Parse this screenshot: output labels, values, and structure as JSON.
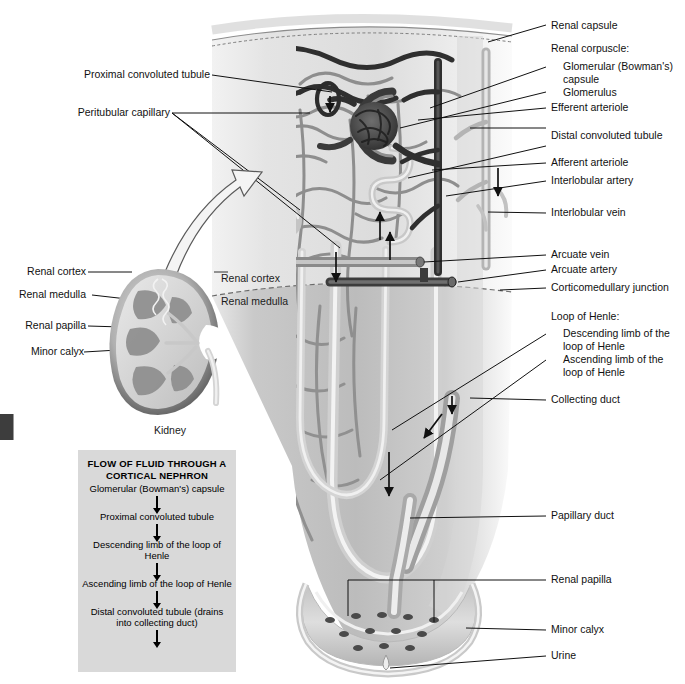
{
  "figure": {
    "background": "#ffffff",
    "line_color": "#111111"
  },
  "inset": {
    "caption": "Kidney",
    "labels": [
      {
        "id": "renal-cortex",
        "text": "Renal cortex"
      },
      {
        "id": "renal-medulla",
        "text": "Renal medulla"
      },
      {
        "id": "renal-papilla",
        "text": "Renal papilla"
      },
      {
        "id": "minor-calyx",
        "text": "Minor calyx"
      }
    ]
  },
  "main_labels_left": [
    {
      "id": "proximal-convoluted-tubule",
      "text": "Proximal convoluted tubule"
    },
    {
      "id": "peritubular-capillary",
      "text": "Peritubular capillary"
    }
  ],
  "main_labels_right": [
    {
      "id": "renal-capsule",
      "text": "Renal capsule"
    },
    {
      "id": "renal-corpuscle",
      "text": "Renal corpuscle:"
    },
    {
      "id": "glomerular-bowmans-capsule",
      "text": "Glomerular (Bowman's)\ncapsule"
    },
    {
      "id": "glomerulus",
      "text": "Glomerulus"
    },
    {
      "id": "efferent-arteriole",
      "text": "Efferent arteriole"
    },
    {
      "id": "distal-convoluted-tubule",
      "text": "Distal convoluted tubule"
    },
    {
      "id": "afferent-arteriole",
      "text": "Afferent arteriole"
    },
    {
      "id": "interlobular-artery",
      "text": "Interlobular artery"
    },
    {
      "id": "interlobular-vein",
      "text": "Interlobular vein"
    },
    {
      "id": "arcuate-vein",
      "text": "Arcuate vein"
    },
    {
      "id": "arcuate-artery",
      "text": "Arcuate artery"
    },
    {
      "id": "corticomedullary-junction",
      "text": "Corticomedullary junction"
    },
    {
      "id": "loop-of-henle",
      "text": "Loop of Henle:"
    },
    {
      "id": "descending-limb",
      "text": "Descending limb of the\nloop of Henle"
    },
    {
      "id": "ascending-limb",
      "text": "Ascending limb of the\nloop of Henle"
    },
    {
      "id": "collecting-duct",
      "text": "Collecting duct"
    },
    {
      "id": "papillary-duct",
      "text": "Papillary duct"
    },
    {
      "id": "renal-papilla-main",
      "text": "Renal papilla"
    },
    {
      "id": "minor-calyx-main",
      "text": "Minor calyx"
    },
    {
      "id": "urine",
      "text": "Urine"
    }
  ],
  "interior_labels": [
    {
      "id": "renal-cortex-interior",
      "text": "Renal cortex"
    },
    {
      "id": "renal-medulla-interior",
      "text": "Renal medulla"
    }
  ],
  "flowchart": {
    "title": "FLOW OF FLUID THROUGH A\nCORTICAL NEPHRON",
    "title_line1": "FLOW OF FLUID THROUGH A",
    "title_line2": "CORTICAL NEPHRON",
    "background": "#d9d9d9",
    "steps": [
      {
        "id": "step-1",
        "text": "Glomerular (Bowman's) capsule"
      },
      {
        "id": "step-2",
        "text": "Proximal convoluted tubule"
      },
      {
        "id": "step-3",
        "text": "Descending limb of the\nloop of Henle"
      },
      {
        "id": "step-4",
        "text": "Ascending limb of the\nloop of Henle"
      },
      {
        "id": "step-5",
        "text": "Distal convoluted tubule\n(drains into collecting duct)"
      }
    ]
  }
}
